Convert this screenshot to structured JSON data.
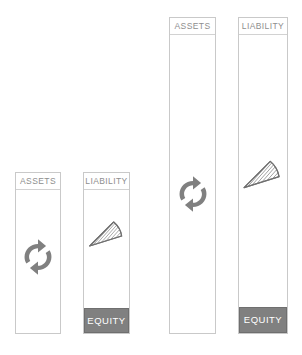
{
  "diagram": {
    "background_color": "#ffffff",
    "border_color": "#c9c9c9",
    "label_text_color": "#8e8e8e",
    "equity_fill_color": "#808080",
    "equity_text_color": "#ffffff",
    "icon_color": "#808080"
  },
  "bars": [
    {
      "id": "assets-before",
      "header_label": "ASSETS",
      "icon": "recycle-arrows-icon",
      "has_equity": false,
      "equity_label": "",
      "group": "before"
    },
    {
      "id": "liability-before",
      "header_label": "LIABILITY",
      "icon": "pie-wedge-icon",
      "has_equity": true,
      "equity_label": "EQUITY",
      "group": "before"
    },
    {
      "id": "assets-after",
      "header_label": "ASSETS",
      "icon": "recycle-arrows-icon",
      "has_equity": false,
      "equity_label": "",
      "group": "after"
    },
    {
      "id": "liability-after",
      "header_label": "LIABILITY",
      "icon": "pie-wedge-icon",
      "has_equity": true,
      "equity_label": "EQUITY",
      "group": "after"
    }
  ]
}
